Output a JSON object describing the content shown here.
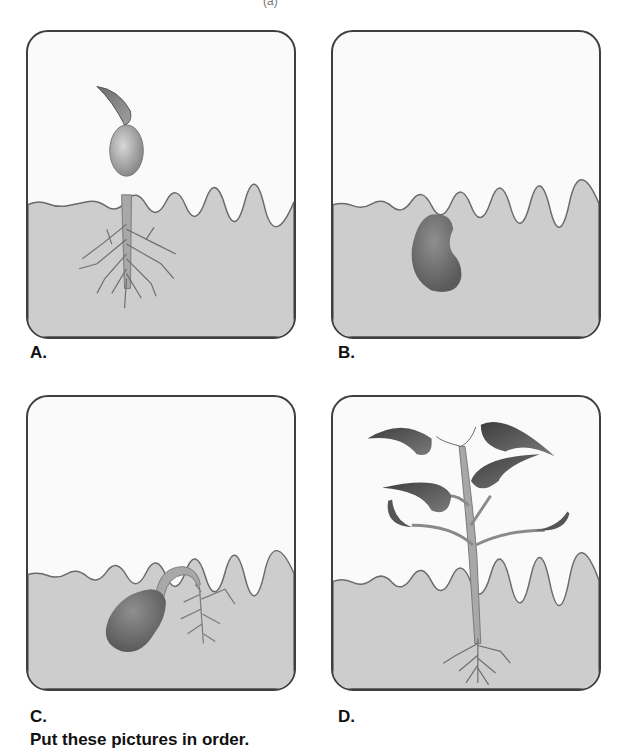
{
  "top_fragment": "(a)",
  "panels": [
    {
      "id": "A",
      "label": "A.",
      "stage": "seedling-emerging",
      "description": "Seedling with cotyledons above soil and branched roots below"
    },
    {
      "id": "B",
      "label": "B.",
      "stage": "seed",
      "description": "Bean seed buried in soil"
    },
    {
      "id": "C",
      "label": "C.",
      "stage": "germinating-seed",
      "description": "Seed in soil with root emerging and hypocotyl hook"
    },
    {
      "id": "D",
      "label": "D.",
      "stage": "young-plant",
      "description": "Young plant with leaves above ground and roots below"
    }
  ],
  "caption": "Put these pictures in order.",
  "colors": {
    "sky": "#fafafa",
    "soil": "#cdcdcd",
    "border": "#3f3f3f",
    "seed": "#6e6e6e",
    "leaf": "#555555",
    "stem": "#a8a8a8"
  }
}
